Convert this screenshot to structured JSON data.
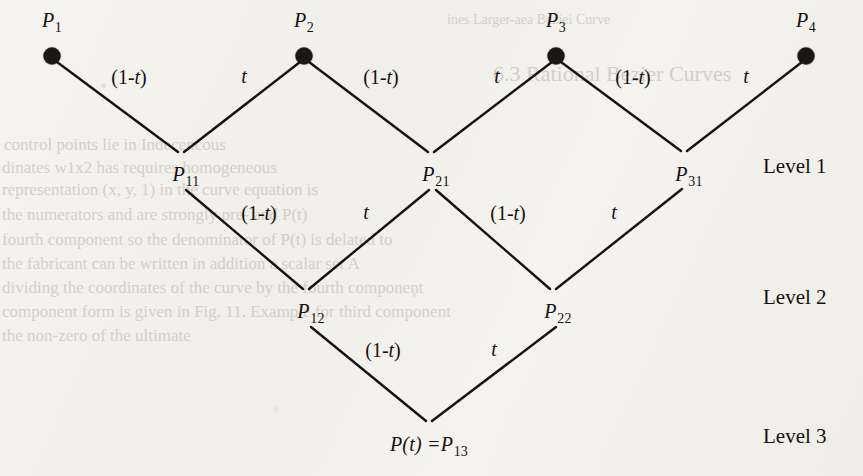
{
  "figure": {
    "kind": "de-casteljau-tree",
    "background_color": "#f4f2ee",
    "ink_color": "#15120f",
    "levels": [
      {
        "id": "level1",
        "label": "Level 1",
        "x": 763,
        "y": 166
      },
      {
        "id": "level2",
        "label": "Level 2",
        "x": 763,
        "y": 297
      },
      {
        "id": "level3",
        "label": "Level 3",
        "x": 763,
        "y": 436
      }
    ],
    "nodes": [
      {
        "id": "P1",
        "base": "P",
        "sub": "1",
        "x": 52,
        "y": 56,
        "dot": true,
        "label_x": 52,
        "label_y": 22
      },
      {
        "id": "P2",
        "base": "P",
        "sub": "2",
        "x": 304,
        "y": 56,
        "dot": true,
        "label_x": 304,
        "label_y": 22
      },
      {
        "id": "P3",
        "base": "P",
        "sub": "3",
        "x": 556,
        "y": 56,
        "dot": true,
        "label_x": 556,
        "label_y": 22
      },
      {
        "id": "P4",
        "base": "P",
        "sub": "4",
        "x": 806,
        "y": 56,
        "dot": true,
        "label_x": 806,
        "label_y": 22
      },
      {
        "id": "P11",
        "base": "P",
        "sub": "11",
        "x": 181,
        "y": 155,
        "dot": false,
        "label_x": 186,
        "label_y": 176
      },
      {
        "id": "P21",
        "base": "P",
        "sub": "21",
        "x": 431,
        "y": 155,
        "dot": false,
        "label_x": 436,
        "label_y": 176
      },
      {
        "id": "P31",
        "base": "P",
        "sub": "31",
        "x": 684,
        "y": 154,
        "dot": false,
        "label_x": 689,
        "label_y": 176
      },
      {
        "id": "P12",
        "base": "P",
        "sub": "12",
        "x": 306,
        "y": 292,
        "dot": false,
        "label_x": 311,
        "label_y": 313
      },
      {
        "id": "P22",
        "base": "P",
        "sub": "22",
        "x": 553,
        "y": 292,
        "dot": false,
        "label_x": 558,
        "label_y": 313
      }
    ],
    "result_node": {
      "id": "P13",
      "prefix": "P(t) =",
      "base": "P",
      "sub": "13",
      "x": 429,
      "y": 424,
      "label_x": 429,
      "label_y": 446
    },
    "edges": [
      {
        "id": "e-P1-P11",
        "x1": 57,
        "y1": 62,
        "x2": 178,
        "y2": 152
      },
      {
        "id": "e-P11-P2",
        "x1": 184,
        "y1": 152,
        "x2": 300,
        "y2": 62
      },
      {
        "id": "e-P2-P21",
        "x1": 309,
        "y1": 62,
        "x2": 428,
        "y2": 152
      },
      {
        "id": "e-P21-P3",
        "x1": 434,
        "y1": 152,
        "x2": 552,
        "y2": 62
      },
      {
        "id": "e-P3-P31",
        "x1": 561,
        "y1": 62,
        "x2": 681,
        "y2": 151
      },
      {
        "id": "e-P31-P4",
        "x1": 687,
        "y1": 151,
        "x2": 802,
        "y2": 62
      },
      {
        "id": "e-P11-P12",
        "x1": 186,
        "y1": 190,
        "x2": 303,
        "y2": 289
      },
      {
        "id": "e-P12-P21",
        "x1": 309,
        "y1": 289,
        "x2": 429,
        "y2": 190
      },
      {
        "id": "e-P21-P22",
        "x1": 436,
        "y1": 190,
        "x2": 550,
        "y2": 289
      },
      {
        "id": "e-P22-P31",
        "x1": 556,
        "y1": 289,
        "x2": 682,
        "y2": 189
      },
      {
        "id": "e-P12-P13",
        "x1": 311,
        "y1": 327,
        "x2": 426,
        "y2": 421
      },
      {
        "id": "e-P13-P22",
        "x1": 432,
        "y1": 421,
        "x2": 556,
        "y2": 327
      }
    ],
    "edge_labels": [
      {
        "id": "lbl-l1-a",
        "text": "(1-t)",
        "roman_open": "(1-",
        "italic": "t",
        "roman_close": ")",
        "x": 129,
        "y": 77
      },
      {
        "id": "lbl-l1-b",
        "text": "t",
        "roman_open": "",
        "italic": "t",
        "roman_close": "",
        "x": 244,
        "y": 76
      },
      {
        "id": "lbl-l1-c",
        "text": "(1-t)",
        "roman_open": "(1-",
        "italic": "t",
        "roman_close": ")",
        "x": 381,
        "y": 77
      },
      {
        "id": "lbl-l1-d",
        "text": "t",
        "roman_open": "",
        "italic": "t",
        "roman_close": "",
        "x": 497,
        "y": 76
      },
      {
        "id": "lbl-l1-e",
        "text": "(1-t)",
        "roman_open": "(1-",
        "italic": "t",
        "roman_close": ")",
        "x": 633,
        "y": 77
      },
      {
        "id": "lbl-l1-f",
        "text": "t",
        "roman_open": "",
        "italic": "t",
        "roman_close": "",
        "x": 746,
        "y": 76
      },
      {
        "id": "lbl-l2-a",
        "text": "(1-t)",
        "roman_open": "(1-",
        "italic": "t",
        "roman_close": ")",
        "x": 259,
        "y": 213
      },
      {
        "id": "lbl-l2-b",
        "text": "t",
        "roman_open": "",
        "italic": "t",
        "roman_close": "",
        "x": 366,
        "y": 212
      },
      {
        "id": "lbl-l2-c",
        "text": "(1-t)",
        "roman_open": "(1-",
        "italic": "t",
        "roman_close": ")",
        "x": 508,
        "y": 213
      },
      {
        "id": "lbl-l2-d",
        "text": "t",
        "roman_open": "",
        "italic": "t",
        "roman_close": "",
        "x": 614,
        "y": 212
      },
      {
        "id": "lbl-l3-a",
        "text": "(1-t)",
        "roman_open": "(1-",
        "italic": "t",
        "roman_close": ")",
        "x": 383,
        "y": 350
      },
      {
        "id": "lbl-l3-b",
        "text": "t",
        "roman_open": "",
        "italic": "t",
        "roman_close": "",
        "x": 494,
        "y": 349
      }
    ],
    "bleed_text": [
      {
        "id": "b1",
        "text": "ines Larger-aea Beziei Curve",
        "x": 447,
        "y": 12,
        "size": 14,
        "mirrored": false
      },
      {
        "id": "b2",
        "text": "6.3  Rational Bezier Curves",
        "x": 493,
        "y": 61,
        "size": 22,
        "mirrored": false
      },
      {
        "id": "b3",
        "text": "control points    lie in  Indecencous",
        "x": 4,
        "y": 135,
        "size": 17,
        "mirrored": false
      },
      {
        "id": "b4",
        "text": "dinates  w1x2 has  requires  homogeneous",
        "x": 2,
        "y": 158,
        "size": 17,
        "mirrored": false
      },
      {
        "id": "b5",
        "text": "representation  (x,  y, 1)  in  the curve equation is",
        "x": 2,
        "y": 180,
        "size": 17,
        "mirrored": false
      },
      {
        "id": "b6",
        "text": "the  numerators  and  are  strongly  pre-   and  P(t)",
        "x": 2,
        "y": 205,
        "size": 17,
        "mirrored": false
      },
      {
        "id": "b7",
        "text": "fourth  component   so  the  denominator  of  P(t)  is delated to",
        "x": 2,
        "y": 230,
        "size": 17,
        "mirrored": false
      },
      {
        "id": "b8",
        "text": "the  fabricant  can  be  written  in  addition  a  scalar  set  A",
        "x": 2,
        "y": 254,
        "size": 17,
        "mirrored": false
      },
      {
        "id": "b9",
        "text": "dividing  the  coordinates  of  the  curve  by  the  fourth  component",
        "x": 2,
        "y": 278,
        "size": 17,
        "mirrored": false
      },
      {
        "id": "b10",
        "text": "component  form  is  given  in  Fig.  11.  Example  for third component",
        "x": 2,
        "y": 302,
        "size": 17,
        "mirrored": false
      },
      {
        "id": "b11",
        "text": "the  non-zero  of  the  ultimate",
        "x": 2,
        "y": 326,
        "size": 17,
        "mirrored": false
      }
    ]
  }
}
